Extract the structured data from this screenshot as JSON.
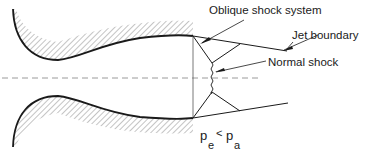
{
  "diagram": {
    "labels": {
      "oblique_shock": "Oblique shock system",
      "jet_boundary": "Jet boundary",
      "normal_shock": "Normal shock",
      "condition_p1": "p",
      "condition_sub1": "e",
      "condition_op": "<",
      "condition_p2": "p",
      "condition_sub2": "a"
    },
    "colors": {
      "line": "#1a1a1a",
      "hatch": "#8a8a8a",
      "axis": "#9a9a9a"
    }
  }
}
